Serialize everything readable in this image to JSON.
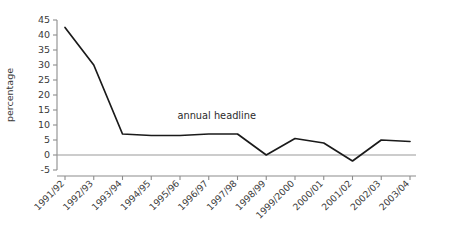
{
  "chart_data": {
    "type": "line",
    "title": "",
    "subtitle": "",
    "xlabel": "",
    "ylabel": "percentage",
    "grid": false,
    "legend_position": "inline-annotation",
    "categories": [
      "1991/92",
      "1992/93",
      "1993/94",
      "1994/95",
      "1995/96",
      "1996/97",
      "1997/98",
      "1998/99",
      "1999/2000",
      "2000/01",
      "2001/02",
      "2002/03",
      "2003/04"
    ],
    "series": [
      {
        "name": "annual headline",
        "values": [
          42.5,
          30,
          7,
          6.5,
          6.5,
          7,
          7,
          0,
          5.5,
          4,
          -2,
          5,
          4.5
        ]
      }
    ],
    "ylim": [
      -5,
      45
    ],
    "yticks": [
      -5,
      0,
      5,
      10,
      15,
      20,
      25,
      30,
      35,
      40,
      45
    ],
    "ytick_labels": [
      "-5",
      "0",
      "5",
      "10",
      "15",
      "20",
      "25",
      "30",
      "35",
      "40",
      "45"
    ],
    "zero_line": 0,
    "annotations": [
      {
        "text": "annual headline",
        "x_category": "1996/97",
        "y_value": 12
      }
    ],
    "colors": {
      "line": "#1a1a1a",
      "axis": "#8c8c8c",
      "zero_line": "#9a9a9a",
      "text": "#3a3a3a",
      "background": "#ffffff"
    }
  }
}
